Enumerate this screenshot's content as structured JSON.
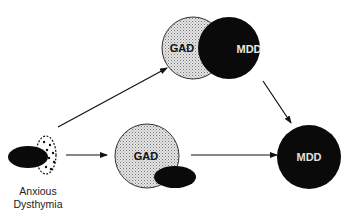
{
  "diagram": {
    "nodes": {
      "anxious_dysthymia": {
        "label_line1": "Anxious",
        "label_line2": "Dysthymia"
      },
      "venn_gad": {
        "label": "GAD"
      },
      "venn_mdd": {
        "label": "MDD"
      },
      "mid_gad": {
        "label": "GAD"
      },
      "final_mdd": {
        "label": "MDD"
      }
    },
    "edges": [
      {
        "from": "anxious_dysthymia",
        "to": "venn_gad_mdd"
      },
      {
        "from": "anxious_dysthymia",
        "to": "mid_gad"
      },
      {
        "from": "venn_gad_mdd",
        "to": "final_mdd"
      },
      {
        "from": "mid_gad",
        "to": "final_mdd"
      }
    ],
    "colors": {
      "black": "#0a0a0a",
      "stipple": "#cfcfcf",
      "white_text": "#e8e8e8"
    }
  }
}
